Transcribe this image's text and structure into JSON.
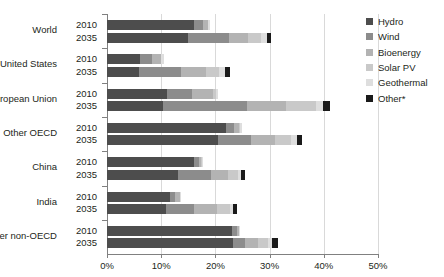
{
  "chart_data": {
    "type": "bar",
    "orientation": "horizontal",
    "stacked": true,
    "title": "",
    "xlabel": "",
    "ylabel": "",
    "xlim": [
      0,
      50
    ],
    "x_ticks": [
      "0%",
      "10%",
      "20%",
      "30%",
      "40%",
      "50%"
    ],
    "x_tick_values": [
      0,
      10,
      20,
      30,
      40,
      50
    ],
    "grid": "vertical",
    "legend_position": "right",
    "categories": [
      "World",
      "United States",
      "European Union",
      "Other OECD",
      "China",
      "India",
      "Other non-OECD"
    ],
    "subcategories": [
      "2010",
      "2035"
    ],
    "series": [
      {
        "name": "Hydro",
        "color": "#4d4d4d"
      },
      {
        "name": "Wind",
        "color": "#8c8c8c"
      },
      {
        "name": "Bioenergy",
        "color": "#b3b3b3"
      },
      {
        "name": "Solar PV",
        "color": "#c9c9c9"
      },
      {
        "name": "Geothermal",
        "color": "#dedede"
      },
      {
        "name": "Other*",
        "color": "#1a1a1a"
      }
    ],
    "rows": [
      {
        "group": "World",
        "year": "2010",
        "values": [
          16.0,
          1.7,
          0.9,
          0.1,
          0.3,
          0.0
        ],
        "total": 19.0
      },
      {
        "group": "World",
        "year": "2035",
        "values": [
          15.0,
          7.5,
          3.5,
          2.4,
          1.1,
          0.8
        ],
        "total": 30.3
      },
      {
        "group": "United States",
        "year": "2010",
        "values": [
          6.0,
          2.3,
          1.6,
          0.1,
          0.5,
          0.0
        ],
        "total": 10.5
      },
      {
        "group": "United States",
        "year": "2035",
        "values": [
          5.9,
          7.7,
          4.6,
          2.5,
          1.0,
          1.0
        ],
        "total": 22.7
      },
      {
        "group": "European Union",
        "year": "2010",
        "values": [
          11.0,
          4.7,
          3.8,
          0.7,
          0.3,
          0.0
        ],
        "total": 20.5
      },
      {
        "group": "European Union",
        "year": "2035",
        "values": [
          10.4,
          15.5,
          7.1,
          5.5,
          1.3,
          1.3
        ],
        "total": 41.1
      },
      {
        "group": "Other OECD",
        "year": "2010",
        "values": [
          22.0,
          1.5,
          0.9,
          0.1,
          0.5,
          0.0
        ],
        "total": 25.0
      },
      {
        "group": "Other OECD",
        "year": "2035",
        "values": [
          20.5,
          6.0,
          4.5,
          3.0,
          1.0,
          1.0
        ],
        "total": 36.0
      },
      {
        "group": "China",
        "year": "2010",
        "values": [
          16.0,
          1.0,
          0.4,
          0.1,
          0.2,
          0.0
        ],
        "total": 17.7
      },
      {
        "group": "China",
        "year": "2035",
        "values": [
          13.1,
          6.0,
          3.2,
          1.9,
          0.5,
          0.8
        ],
        "total": 25.5
      },
      {
        "group": "India",
        "year": "2010",
        "values": [
          11.6,
          1.0,
          0.8,
          0.1,
          0.1,
          0.0
        ],
        "total": 13.6
      },
      {
        "group": "India",
        "year": "2035",
        "values": [
          10.9,
          5.1,
          4.3,
          2.4,
          0.5,
          0.8
        ],
        "total": 24.0
      },
      {
        "group": "Other non-OECD",
        "year": "2010",
        "values": [
          23.1,
          0.9,
          0.3,
          0.1,
          0.1,
          0.0
        ],
        "total": 24.5
      },
      {
        "group": "Other non-OECD",
        "year": "2035",
        "values": [
          23.2,
          2.2,
          2.4,
          1.9,
          0.8,
          1.0
        ],
        "total": 31.5
      }
    ]
  }
}
